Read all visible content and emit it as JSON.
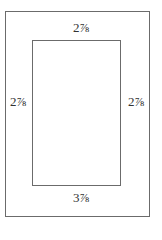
{
  "diagram": {
    "outer_frame": {
      "label": "outer-frame"
    },
    "inner_opening": {
      "label": "inner-opening"
    },
    "margins": {
      "top": "2⅞",
      "left": "2⅞",
      "right": "2⅞",
      "bottom": "3⅞"
    }
  }
}
